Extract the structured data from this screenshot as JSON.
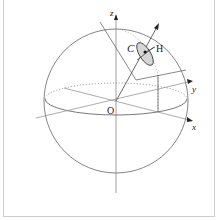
{
  "diagram": {
    "type": "sphere-coordinate-diagram",
    "labels": {
      "origin": "O",
      "z_axis": "z",
      "y_axis": "y",
      "x_axis": "x",
      "point_c": "C",
      "point_h": "H"
    },
    "colors": {
      "line": "#555555",
      "light_line": "#8a8a8a",
      "ellipse_fill": "#d6d6d6",
      "frame": "#cfcfcf"
    }
  }
}
